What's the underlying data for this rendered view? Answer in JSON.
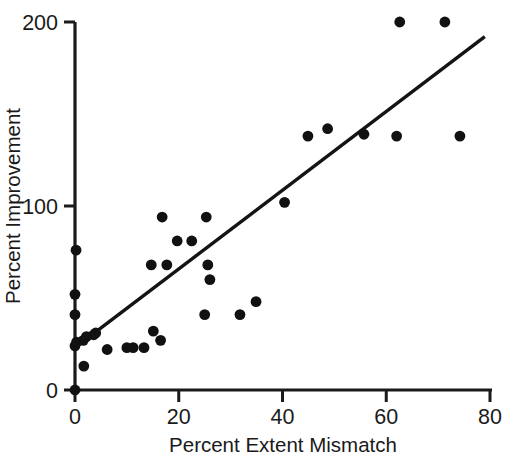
{
  "chart_data": {
    "type": "scatter",
    "title": "",
    "xlabel": "Percent Extent Mismatch",
    "ylabel": "Percent Improvement",
    "xlim": [
      0,
      80
    ],
    "ylim": [
      0,
      200
    ],
    "xticks": [
      0,
      20,
      40,
      60,
      80
    ],
    "yticks": [
      0,
      100,
      200
    ],
    "xticklabels": [
      "0",
      "20",
      "40",
      "60",
      "80"
    ],
    "yticklabels": [
      "0",
      "100",
      "200"
    ],
    "grid": false,
    "legend": null,
    "marker": "filled-circle",
    "marker_color": "#111111",
    "points": [
      {
        "x": 0.0,
        "y": 0
      },
      {
        "x": 0.0,
        "y": 24
      },
      {
        "x": 0.3,
        "y": 26
      },
      {
        "x": 0.0,
        "y": 41
      },
      {
        "x": 0.0,
        "y": 52
      },
      {
        "x": 0.2,
        "y": 76
      },
      {
        "x": 1.7,
        "y": 13
      },
      {
        "x": 1.6,
        "y": 27
      },
      {
        "x": 2.2,
        "y": 29
      },
      {
        "x": 3.6,
        "y": 30
      },
      {
        "x": 4.0,
        "y": 31
      },
      {
        "x": 6.2,
        "y": 22
      },
      {
        "x": 10.0,
        "y": 23
      },
      {
        "x": 11.2,
        "y": 23
      },
      {
        "x": 13.3,
        "y": 23
      },
      {
        "x": 14.7,
        "y": 68
      },
      {
        "x": 15.1,
        "y": 32
      },
      {
        "x": 16.8,
        "y": 94
      },
      {
        "x": 16.5,
        "y": 27
      },
      {
        "x": 17.7,
        "y": 68
      },
      {
        "x": 19.7,
        "y": 81
      },
      {
        "x": 22.5,
        "y": 81
      },
      {
        "x": 25.3,
        "y": 94
      },
      {
        "x": 25.0,
        "y": 41
      },
      {
        "x": 25.6,
        "y": 68
      },
      {
        "x": 26.0,
        "y": 60
      },
      {
        "x": 31.8,
        "y": 41
      },
      {
        "x": 34.9,
        "y": 48
      },
      {
        "x": 40.4,
        "y": 102
      },
      {
        "x": 44.9,
        "y": 138
      },
      {
        "x": 48.7,
        "y": 142
      },
      {
        "x": 55.7,
        "y": 139
      },
      {
        "x": 62.0,
        "y": 138
      },
      {
        "x": 62.6,
        "y": 200
      },
      {
        "x": 71.3,
        "y": 200
      },
      {
        "x": 74.2,
        "y": 138
      }
    ],
    "trendline": {
      "type": "linear-fit",
      "x_start": 0.0,
      "y_start": 23,
      "x_end": 79.0,
      "y_end": 192
    }
  },
  "figure": {
    "background_color": "#ffffff",
    "axis_color": "#1a1a1a",
    "data_color": "#111111"
  }
}
